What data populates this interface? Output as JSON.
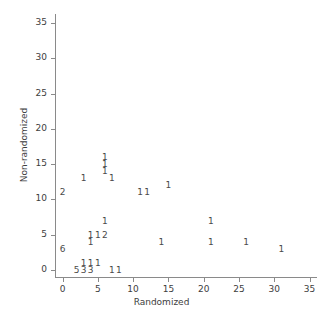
{
  "chart_data": {
    "type": "scatter",
    "title": "",
    "xlabel": "Randomized",
    "ylabel": "Non-randomized",
    "xlim": [
      0,
      35
    ],
    "ylim": [
      0,
      35
    ],
    "xticks": [
      0,
      5,
      10,
      15,
      20,
      25,
      30,
      35
    ],
    "yticks": [
      0,
      5,
      10,
      15,
      20,
      25,
      30,
      35
    ],
    "xtick_labels": [
      "0",
      "5",
      "10",
      "15",
      "20",
      "25",
      "30",
      "35"
    ],
    "ytick_labels": [
      "0",
      "5",
      "10",
      "15",
      "20",
      "25",
      "30",
      "35"
    ],
    "grid": false,
    "legend": "none",
    "marker_style": "count-digit",
    "note": "Each marker is a digit giving the number of overlapping observations at that coordinate.",
    "points": [
      {
        "x": 0,
        "y": 11,
        "label": "2"
      },
      {
        "x": 3,
        "y": 13,
        "label": "1"
      },
      {
        "x": 6,
        "y": 16,
        "label": "1"
      },
      {
        "x": 6,
        "y": 15,
        "label": "1"
      },
      {
        "x": 6,
        "y": 14,
        "label": "1"
      },
      {
        "x": 7,
        "y": 13,
        "label": "1"
      },
      {
        "x": 11,
        "y": 11,
        "label": "1"
      },
      {
        "x": 12,
        "y": 11,
        "label": "1"
      },
      {
        "x": 15,
        "y": 12,
        "label": "1"
      },
      {
        "x": 6,
        "y": 7,
        "label": "1"
      },
      {
        "x": 21,
        "y": 7,
        "label": "1"
      },
      {
        "x": 0,
        "y": 3,
        "label": "6"
      },
      {
        "x": 4,
        "y": 5,
        "label": "1"
      },
      {
        "x": 5,
        "y": 5,
        "label": "1"
      },
      {
        "x": 6,
        "y": 5,
        "label": "2"
      },
      {
        "x": 4,
        "y": 4,
        "label": "1"
      },
      {
        "x": 14,
        "y": 4,
        "label": "1"
      },
      {
        "x": 21,
        "y": 4,
        "label": "1"
      },
      {
        "x": 26,
        "y": 4,
        "label": "1"
      },
      {
        "x": 31,
        "y": 3,
        "label": "1"
      },
      {
        "x": 3,
        "y": 1,
        "label": "1"
      },
      {
        "x": 4,
        "y": 1,
        "label": "1"
      },
      {
        "x": 5,
        "y": 1,
        "label": "1"
      },
      {
        "x": 2,
        "y": 0,
        "label": "5"
      },
      {
        "x": 3,
        "y": 0,
        "label": "3"
      },
      {
        "x": 4,
        "y": 0,
        "label": "3"
      },
      {
        "x": 7,
        "y": 0,
        "label": "1"
      },
      {
        "x": 8,
        "y": 0,
        "label": "1"
      }
    ]
  },
  "style": {
    "axis_color": "#8a8a8a",
    "text_color": "#3d3d3d",
    "marker_color": "#4a4a4a",
    "background": "#ffffff"
  }
}
